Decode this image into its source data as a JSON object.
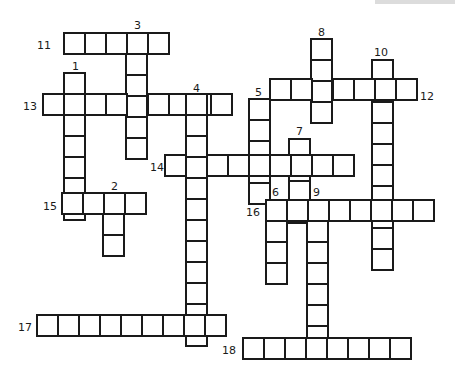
{
  "puzzle": {
    "type": "crossword",
    "cell_size": 21,
    "line_color": "#1a1a1a",
    "background": "#ffffff",
    "entries": [
      {
        "number": "11",
        "direction": "across",
        "length": 5,
        "x": 64,
        "y": 33,
        "label_x": 37,
        "label_y": 40
      },
      {
        "number": "3",
        "direction": "down",
        "length": 6,
        "x": 126,
        "y": 33,
        "label_x": 134,
        "label_y": 20
      },
      {
        "number": "8",
        "direction": "down",
        "length": 4,
        "x": 311,
        "y": 39,
        "label_x": 318,
        "label_y": 27
      },
      {
        "number": "10",
        "direction": "down",
        "length": 10,
        "x": 372,
        "y": 60,
        "label_x": 374,
        "label_y": 47
      },
      {
        "number": "1",
        "direction": "down",
        "length": 7,
        "x": 64,
        "y": 73,
        "label_x": 72,
        "label_y": 61
      },
      {
        "number": "12",
        "direction": "across",
        "length": 7,
        "x": 270,
        "y": 79,
        "label_x": 420,
        "label_y": 91
      },
      {
        "number": "13",
        "direction": "across",
        "length": 9,
        "x": 43,
        "y": 94,
        "label_x": 23,
        "label_y": 101
      },
      {
        "number": "4",
        "direction": "down",
        "length": 12,
        "x": 186,
        "y": 94,
        "label_x": 193,
        "label_y": 83
      },
      {
        "number": "5",
        "direction": "down",
        "length": 5,
        "x": 249,
        "y": 99,
        "label_x": 255,
        "label_y": 87
      },
      {
        "number": "7",
        "direction": "down",
        "length": 4,
        "x": 289,
        "y": 139,
        "label_x": 296,
        "label_y": 126
      },
      {
        "number": "14",
        "direction": "across",
        "length": 9,
        "x": 165,
        "y": 155,
        "label_x": 150,
        "label_y": 162
      },
      {
        "number": "15",
        "direction": "across",
        "length": 4,
        "x": 62,
        "y": 193,
        "label_x": 43,
        "label_y": 201
      },
      {
        "number": "2",
        "direction": "down",
        "length": 3,
        "x": 103,
        "y": 193,
        "label_x": 111,
        "label_y": 181
      },
      {
        "number": "16",
        "direction": "across",
        "length": 8,
        "x": 266,
        "y": 200,
        "label_x": 246,
        "label_y": 207
      },
      {
        "number": "6",
        "direction": "down",
        "length": 4,
        "x": 266,
        "y": 200,
        "label_x": 272,
        "label_y": 187
      },
      {
        "number": "9",
        "direction": "down",
        "length": 7,
        "x": 307,
        "y": 200,
        "label_x": 313,
        "label_y": 187
      },
      {
        "number": "17",
        "direction": "across",
        "length": 9,
        "x": 37,
        "y": 315,
        "label_x": 18,
        "label_y": 322
      },
      {
        "number": "18",
        "direction": "across",
        "length": 8,
        "x": 243,
        "y": 338,
        "label_x": 222,
        "label_y": 345
      }
    ]
  }
}
